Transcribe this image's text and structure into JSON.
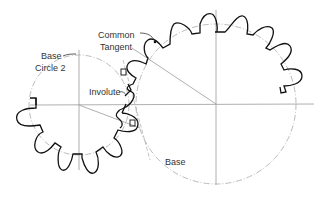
{
  "diagram": {
    "type": "gear-mesh",
    "labels": {
      "common_tangent_line1": "Common",
      "common_tangent_line2": "Tangent",
      "base_circle_line1": "Base",
      "base_circle_line2": "Circle  2",
      "involute": "Involute",
      "base": "Base"
    },
    "colors": {
      "gear_outline": "#111111",
      "center_lines": "#999999",
      "base_circle": "#aaaaaa",
      "text": "#333333"
    }
  }
}
